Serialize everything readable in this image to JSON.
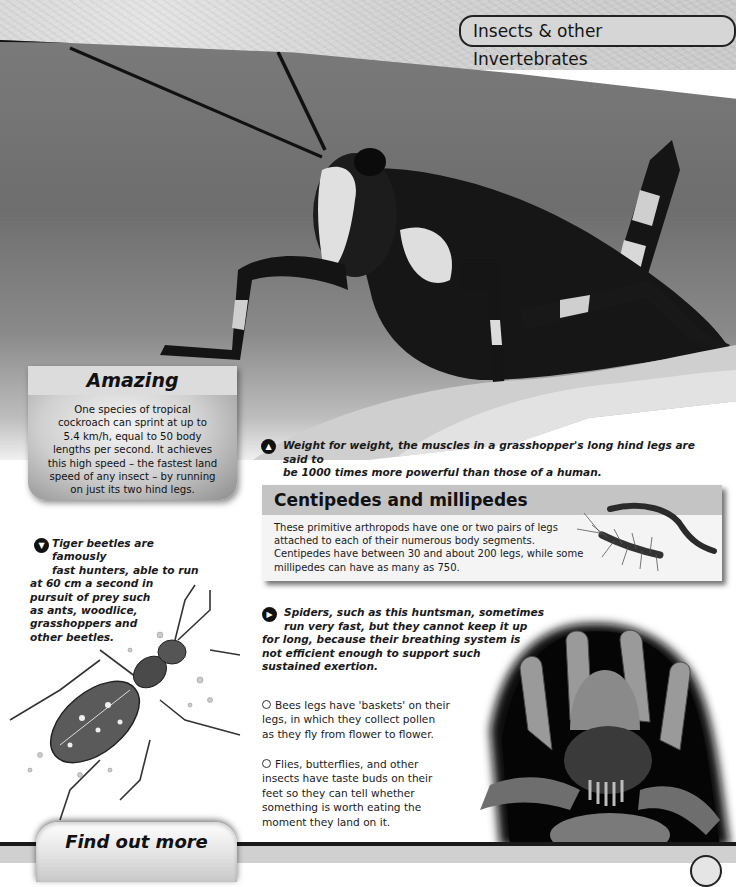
{
  "header": {
    "section_title": "Insects & other Invertebrates"
  },
  "amazing_box": {
    "title": "Amazing",
    "text": "One species of tropical cockroach can sprint at up to 5.4 km/h, equal to 50 body lengths per second. It achieves this high speed – the fastest land speed of any insect – by running on just its two hind legs.",
    "lines": [
      "One species of tropical",
      "cockroach can sprint at up to",
      "5.4 km/h, equal to 50 body",
      "lengths per second. It achieves",
      "this high speed – the fastest land",
      "speed of any insect – by running",
      "on just its two hind legs."
    ]
  },
  "grasshopper_caption": {
    "icon": "arrow-up-icon",
    "line1": "Weight for weight, the muscles in a grasshopper's long hind legs are said to",
    "line2": "be 1000 times more powerful than those of a human."
  },
  "centipedes_box": {
    "title": "Centipedes and millipedes",
    "lines": [
      "These primitive arthropods have one or two pairs of legs",
      "attached to each of their numerous body segments.",
      "Centipedes have between 30 and about 200 legs, while some",
      "millipedes can have as many as 750."
    ]
  },
  "tiger_beetle_caption": {
    "icon": "arrow-down-icon",
    "lines": [
      "Tiger beetles are famously",
      "fast hunters, able to run",
      "at 60 cm a second in",
      "pursuit of prey such",
      "as ants, woodlice,",
      "grasshoppers and",
      "other beetles."
    ]
  },
  "spider_caption": {
    "icon": "arrow-right-icon",
    "lines": [
      "Spiders, such as this huntsman, sometimes",
      "run very fast, but they cannot keep it up",
      "for long, because their breathing system is",
      "not efficient enough to support such",
      "sustained exertion."
    ]
  },
  "facts": {
    "bees": [
      "Bees legs have 'baskets' on their",
      "legs, in which they collect pollen",
      "as they fly from flower to flower."
    ],
    "flies": [
      "Flies, butterflies, and other",
      "insects have taste buds on their",
      "feet so they can tell whether",
      "something is worth eating the",
      "moment they land on it."
    ]
  },
  "find_out_more": {
    "label": "Find out more"
  }
}
